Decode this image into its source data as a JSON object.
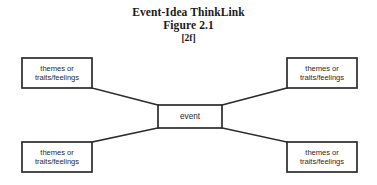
{
  "figure": {
    "title": "Event-Idea ThinkLink",
    "figure_label": "Figure 2.1",
    "reference_code": "[2f]",
    "center_node": {
      "label": "event"
    },
    "outer_nodes": [
      {
        "position": "top-left",
        "label": "themes or\ntraits/feelings"
      },
      {
        "position": "top-right",
        "label": "themes or\ntraits/feelings"
      },
      {
        "position": "bottom-left",
        "label": "themes or\ntraits/feelings"
      },
      {
        "position": "bottom-right",
        "label": "themes or\ntraits/feelings"
      }
    ],
    "colors": {
      "background": "#ffffff",
      "stroke": "#2b2b2b",
      "text": "#2a2a2a",
      "title_text": "#1a1a1a"
    }
  }
}
